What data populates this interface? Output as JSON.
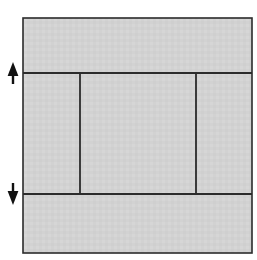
{
  "canvas": {
    "width": 257,
    "height": 260,
    "background_color": "#ffffff"
  },
  "diagram": {
    "title": "",
    "type": "rectangle-partition-with-dimension-arrows",
    "style": {
      "fill_color": "#d2d2d2",
      "stroke_color": "#2b2b2b",
      "outer_stroke_width": 1.6,
      "divider_stroke_width": 1.8,
      "arrow_color": "#111111"
    },
    "outer_rect": {
      "name": "outer-boundary",
      "x": 23,
      "y": 18,
      "width": 229,
      "height": 235
    },
    "horizontal_dividers": [
      {
        "name": "upper-divider",
        "y": 73,
        "x1": 23,
        "x2": 252
      },
      {
        "name": "lower-divider",
        "y": 194,
        "x1": 23,
        "x2": 252
      }
    ],
    "vertical_dividers": [
      {
        "name": "left-vertical-divider",
        "x": 80,
        "y1": 73,
        "y2": 194
      },
      {
        "name": "right-vertical-divider",
        "x": 196,
        "y1": 73,
        "y2": 194
      }
    ],
    "regions": [
      {
        "name": "top-band",
        "label": "",
        "x": 23,
        "y": 18,
        "width": 229,
        "height": 55
      },
      {
        "name": "middle-left-cell",
        "label": "",
        "x": 23,
        "y": 73,
        "width": 57,
        "height": 121
      },
      {
        "name": "middle-center-cell",
        "label": "",
        "x": 80,
        "y": 73,
        "width": 116,
        "height": 121
      },
      {
        "name": "middle-right-cell",
        "label": "",
        "x": 196,
        "y": 73,
        "width": 56,
        "height": 121
      },
      {
        "name": "bottom-band",
        "label": "",
        "x": 23,
        "y": 194,
        "width": 229,
        "height": 59
      }
    ],
    "annotations": [
      {
        "name": "up-arrow",
        "icon": "arrow-up-icon",
        "label": "",
        "tip_x": 13,
        "tip_y": 62,
        "tail_x": 13,
        "tail_y": 84
      },
      {
        "name": "down-arrow",
        "icon": "arrow-down-icon",
        "label": "",
        "tip_x": 13,
        "tip_y": 205,
        "tail_x": 13,
        "tail_y": 183
      }
    ]
  }
}
